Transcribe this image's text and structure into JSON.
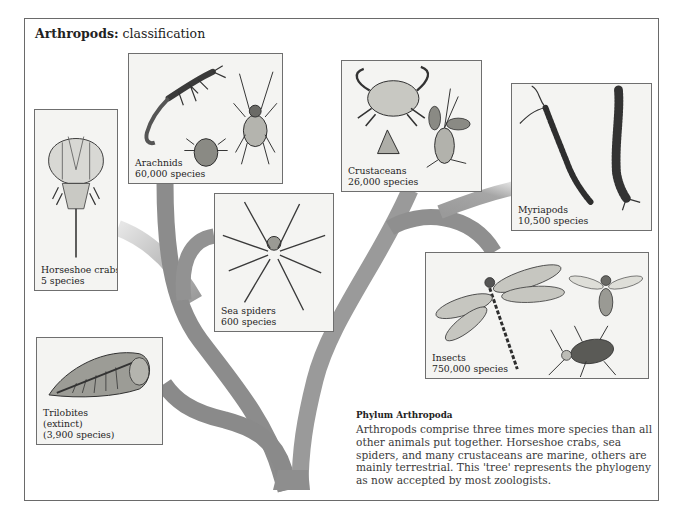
{
  "title": {
    "bold": "Arthropods:",
    "normal": " classification"
  },
  "colors": {
    "frame_border": "#6a6a6a",
    "panel_bg": "#f4f4f2",
    "branch_dark": "#8a8a8a",
    "branch_mid": "#9c9c9c",
    "branch_light": "#c4c4c4",
    "text": "#2a2a2a"
  },
  "groups": [
    {
      "id": "horseshoe-crabs",
      "name": "Horseshoe crabs",
      "species": "5 species",
      "icon": "horseshoe-crab-icon"
    },
    {
      "id": "arachnids",
      "name": "Arachnids",
      "species": "60,000 species",
      "icon": "scorpion-tick-spider-icon"
    },
    {
      "id": "sea-spiders",
      "name": "Sea spiders",
      "species": "600 species",
      "icon": "sea-spider-icon"
    },
    {
      "id": "crustaceans",
      "name": "Crustaceans",
      "species": "26,000 species",
      "icon": "crab-barnacle-shrimp-icon"
    },
    {
      "id": "myriapods",
      "name": "Myriapods",
      "species": "10,500 species",
      "icon": "centipede-millipede-icon"
    },
    {
      "id": "insects",
      "name": "Insects",
      "species": "750,000 species",
      "icon": "dragonfly-wasp-beetle-icon"
    },
    {
      "id": "trilobites",
      "name": "Trilobites",
      "extra": "(extinct)",
      "species": "(3,900 species)",
      "icon": "trilobite-icon"
    }
  ],
  "caption": {
    "heading": "Phylum Arthropoda",
    "body": "Arthropods comprise three times more species than all other animals put together. Horseshoe crabs, sea spiders, and many crustaceans are marine, others are mainly terrestrial. This 'tree' represents the phylogeny as now accepted by most zoologists."
  }
}
